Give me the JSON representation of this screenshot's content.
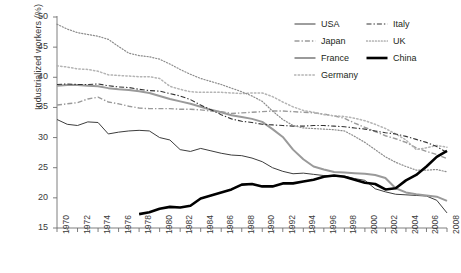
{
  "chart_data": {
    "type": "line",
    "title": "",
    "xlabel": "",
    "ylabel": "Industrialized workers (%)",
    "xlim": [
      1970,
      2008
    ],
    "ylim": [
      15,
      50
    ],
    "yticks": [
      15,
      20,
      25,
      30,
      35,
      40,
      45,
      50
    ],
    "xticks": [
      1970,
      1972,
      1974,
      1976,
      1978,
      1980,
      1982,
      1984,
      1986,
      1988,
      1990,
      1992,
      1994,
      1996,
      1998,
      2000,
      2002,
      2004,
      2006,
      2008
    ],
    "xtick_labels": [
      "1970",
      "1972",
      "1974",
      "1976",
      "1978",
      "1980",
      "1982",
      "1984",
      "1986",
      "1988",
      "1990",
      "1992",
      "1994",
      "1996",
      "1998",
      "2000",
      "2002",
      "2004",
      "2006",
      "2008"
    ],
    "minor_xticks_every": 1,
    "grid": false,
    "legend_position": "top-right",
    "series": [
      {
        "name": "USA",
        "style": "solid",
        "color": "#3d3d3d",
        "width": 1.0,
        "x": [
          1970,
          1971,
          1972,
          1973,
          1974,
          1975,
          1976,
          1977,
          1978,
          1979,
          1980,
          1981,
          1982,
          1983,
          1984,
          1985,
          1986,
          1987,
          1988,
          1989,
          1990,
          1991,
          1992,
          1993,
          1994,
          1995,
          1996,
          1997,
          1998,
          1999,
          2000,
          2001,
          2002,
          2003,
          2004,
          2005,
          2006,
          2007,
          2008
        ],
        "values": [
          33.0,
          32.2,
          32.0,
          32.6,
          32.5,
          30.6,
          30.9,
          31.1,
          31.2,
          31.1,
          30.0,
          29.6,
          28.0,
          27.7,
          28.2,
          27.8,
          27.4,
          27.1,
          27.0,
          26.6,
          26.0,
          25.0,
          24.4,
          24.0,
          24.1,
          23.9,
          23.7,
          23.7,
          23.6,
          23.2,
          22.9,
          21.5,
          21.0,
          20.6,
          20.5,
          20.4,
          20.3,
          19.6,
          17.5
        ]
      },
      {
        "name": "Japan",
        "style": "dash-dot",
        "color": "#9a9a9a",
        "width": 1.4,
        "x": [
          1970,
          1971,
          1972,
          1973,
          1974,
          1975,
          1976,
          1977,
          1978,
          1979,
          1980,
          1981,
          1982,
          1983,
          1984,
          1985,
          1986,
          1987,
          1988,
          1989,
          1990,
          1991,
          1992,
          1993,
          1994,
          1995,
          1996,
          1997,
          1998,
          1999,
          2000,
          2001,
          2002,
          2003,
          2004,
          2005,
          2006,
          2007,
          2008
        ],
        "values": [
          35.4,
          35.6,
          35.8,
          36.4,
          36.7,
          35.9,
          35.6,
          35.2,
          34.9,
          34.8,
          34.8,
          34.8,
          34.7,
          34.7,
          34.6,
          34.4,
          34.3,
          34.0,
          34.1,
          34.2,
          34.3,
          34.4,
          34.4,
          34.3,
          34.2,
          34.1,
          33.9,
          33.6,
          33.2,
          32.4,
          31.7,
          31.0,
          30.3,
          29.8,
          29.2,
          28.3,
          27.7,
          27.2,
          26.5
        ]
      },
      {
        "name": "France",
        "style": "solid",
        "color": "#9a9a9a",
        "width": 2.0,
        "x": [
          1970,
          1971,
          1972,
          1973,
          1974,
          1975,
          1976,
          1977,
          1978,
          1979,
          1980,
          1981,
          1982,
          1983,
          1984,
          1985,
          1986,
          1987,
          1988,
          1989,
          1990,
          1991,
          1992,
          1993,
          1994,
          1995,
          1996,
          1997,
          1998,
          1999,
          2000,
          2001,
          2002,
          2003,
          2004,
          2005,
          2006,
          2007,
          2008
        ],
        "values": [
          38.6,
          38.7,
          38.7,
          38.6,
          38.5,
          38.2,
          38.0,
          37.9,
          37.7,
          37.4,
          36.9,
          36.4,
          36.0,
          35.6,
          35.1,
          34.6,
          34.2,
          33.7,
          33.4,
          33.1,
          32.6,
          31.4,
          30.1,
          28.0,
          26.4,
          25.2,
          24.7,
          24.3,
          24.2,
          24.1,
          24.0,
          23.8,
          23.3,
          21.6,
          20.9,
          20.6,
          20.4,
          20.2,
          19.5
        ]
      },
      {
        "name": "Germany",
        "style": "dotted",
        "color": "#b4b4b4",
        "width": 1.5,
        "x": [
          1970,
          1971,
          1972,
          1973,
          1974,
          1975,
          1976,
          1977,
          1978,
          1979,
          1980,
          1981,
          1982,
          1983,
          1984,
          1985,
          1986,
          1987,
          1988,
          1989,
          1990,
          1991,
          1992,
          1993,
          1994,
          1995,
          1996,
          1997,
          1998,
          1999,
          2000,
          2001,
          2002,
          2003,
          2004,
          2005,
          2006,
          2007,
          2008
        ],
        "values": [
          41.9,
          41.7,
          41.4,
          41.3,
          41.0,
          40.4,
          40.3,
          40.2,
          40.1,
          40.1,
          39.8,
          38.5,
          38.0,
          37.6,
          37.5,
          37.5,
          37.5,
          37.4,
          37.3,
          37.4,
          37.4,
          36.8,
          35.9,
          35.1,
          34.5,
          34.2,
          33.8,
          33.6,
          33.5,
          33.2,
          32.8,
          32.2,
          31.5,
          30.6,
          29.6,
          28.0,
          28.3,
          28.7,
          28.4
        ]
      },
      {
        "name": "Italy",
        "style": "dash-dot",
        "color": "#333333",
        "width": 1.1,
        "x": [
          1970,
          1971,
          1972,
          1973,
          1974,
          1975,
          1976,
          1977,
          1978,
          1979,
          1980,
          1981,
          1982,
          1983,
          1984,
          1985,
          1986,
          1987,
          1988,
          1989,
          1990,
          1991,
          1992,
          1993,
          1994,
          1995,
          1996,
          1997,
          1998,
          1999,
          2000,
          2001,
          2002,
          2003,
          2004,
          2005,
          2006,
          2007,
          2008
        ],
        "values": [
          38.8,
          38.9,
          38.8,
          38.8,
          38.9,
          38.6,
          38.4,
          38.3,
          38.0,
          37.8,
          37.7,
          37.3,
          36.9,
          36.3,
          35.4,
          34.6,
          33.8,
          33.1,
          32.7,
          32.5,
          32.2,
          32.1,
          32.0,
          31.9,
          31.9,
          32.0,
          32.0,
          31.9,
          31.8,
          31.6,
          31.4,
          31.1,
          30.8,
          30.6,
          30.2,
          29.7,
          29.2,
          28.5,
          27.5
        ]
      },
      {
        "name": "UK",
        "style": "dotted",
        "color": "#8c8c8c",
        "width": 1.2,
        "x": [
          1970,
          1971,
          1972,
          1973,
          1974,
          1975,
          1976,
          1977,
          1978,
          1979,
          1980,
          1981,
          1982,
          1983,
          1984,
          1985,
          1986,
          1987,
          1988,
          1989,
          1990,
          1991,
          1992,
          1993,
          1994,
          1995,
          1996,
          1997,
          1998,
          1999,
          2000,
          2001,
          2002,
          2003,
          2004,
          2005,
          2006,
          2007,
          2008
        ],
        "values": [
          48.8,
          48.0,
          47.4,
          47.1,
          46.8,
          46.3,
          45.1,
          44.0,
          43.6,
          43.4,
          43.0,
          42.2,
          41.3,
          40.5,
          39.8,
          39.3,
          38.8,
          38.2,
          37.6,
          36.9,
          36.0,
          34.4,
          33.0,
          32.0,
          31.6,
          31.5,
          31.4,
          31.3,
          31.1,
          30.2,
          29.2,
          28.0,
          26.8,
          25.9,
          25.2,
          24.6,
          24.6,
          24.7,
          24.3
        ]
      },
      {
        "name": "China",
        "style": "solid",
        "color": "#000000",
        "width": 2.6,
        "x": [
          1978,
          1979,
          1980,
          1981,
          1982,
          1983,
          1984,
          1985,
          1986,
          1987,
          1988,
          1989,
          1990,
          1991,
          1992,
          1993,
          1994,
          1995,
          1996,
          1997,
          1998,
          1999,
          2000,
          2001,
          2002,
          2003,
          2004,
          2005,
          2006,
          2007,
          2008
        ],
        "values": [
          17.3,
          17.6,
          18.2,
          18.5,
          18.4,
          18.7,
          19.9,
          20.4,
          20.9,
          21.4,
          22.2,
          22.3,
          21.9,
          21.9,
          22.4,
          22.4,
          22.7,
          23.0,
          23.5,
          23.7,
          23.5,
          23.0,
          22.5,
          22.3,
          21.4,
          21.6,
          22.9,
          23.8,
          25.2,
          26.8,
          27.8
        ]
      }
    ]
  },
  "axis": {
    "y_title": "Industrialized workers (%)",
    "y_tick_labels": [
      "50",
      "45",
      "40",
      "35",
      "30",
      "25",
      "20",
      "15"
    ]
  },
  "legend": {
    "entries": [
      {
        "label": "USA",
        "style": "solid",
        "color": "#3d3d3d",
        "width": 1.0
      },
      {
        "label": "Italy",
        "style": "dash-dot",
        "color": "#333333",
        "width": 1.1
      },
      {
        "label": "Japan",
        "style": "dash-dot",
        "color": "#9a9a9a",
        "width": 1.4
      },
      {
        "label": "UK",
        "style": "dotted",
        "color": "#8c8c8c",
        "width": 1.2
      },
      {
        "label": "France",
        "style": "solid",
        "color": "#9a9a9a",
        "width": 2.0
      },
      {
        "label": "China",
        "style": "solid",
        "color": "#000000",
        "width": 2.6
      },
      {
        "label": "Germany",
        "style": "dotted",
        "color": "#b4b4b4",
        "width": 1.5
      }
    ]
  },
  "colors": {
    "axis": "#6f6f6f",
    "text": "#3a3a3a",
    "background": "#ffffff"
  }
}
